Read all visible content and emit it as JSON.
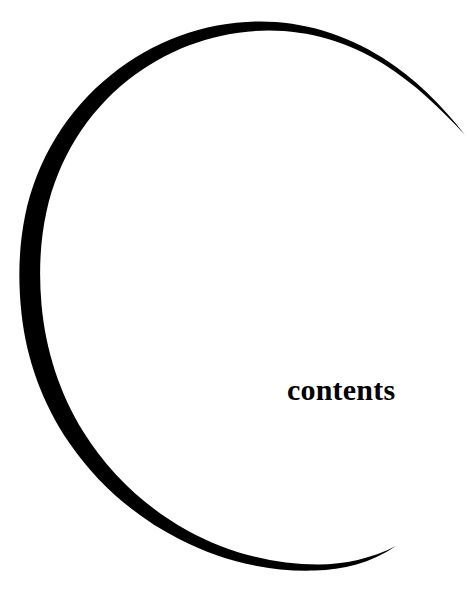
{
  "page": {
    "width": 468,
    "height": 609,
    "background_color": "#ffffff",
    "ink_color": "#000000"
  },
  "heading": {
    "text": "contents",
    "color": "#000000",
    "style": "bold-serif",
    "font_size_px": 30,
    "position": {
      "x": 287,
      "y": 374
    }
  },
  "decoration": {
    "name": "open-circle-arc",
    "shape": "circle",
    "open_side": "right",
    "stroke_color": "#000000",
    "fill": "none",
    "center": {
      "x": 245,
      "y": 300
    },
    "radius_x": 224,
    "radius_y": 268,
    "max_stroke_width_px": 9,
    "min_stroke_width_px": 0,
    "tapered_ends": true,
    "start_point": {
      "x": 465,
      "y": 135
    },
    "end_point": {
      "x": 396,
      "y": 546
    },
    "extremes": {
      "leftmost_x": 21,
      "topmost_y": 34,
      "bottommost_y": 570,
      "rightmost_x": 465
    }
  }
}
